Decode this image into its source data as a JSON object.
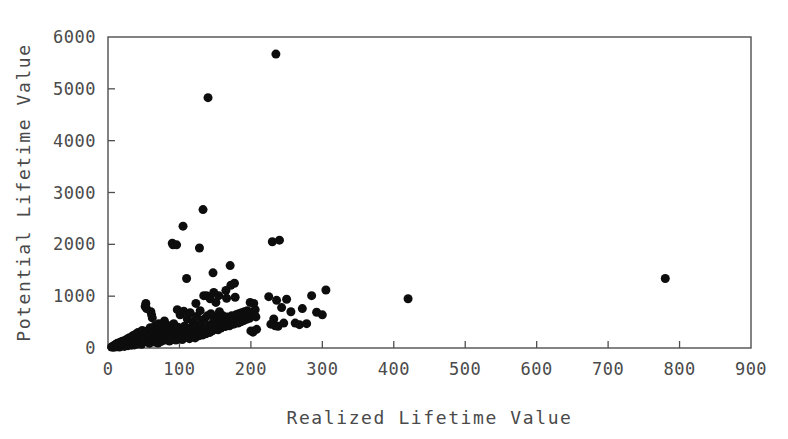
{
  "chart_data": {
    "type": "scatter",
    "title": "",
    "xlabel": "Realized Lifetime Value",
    "ylabel": "Potential Lifetime Value",
    "xlim": [
      0,
      900
    ],
    "ylim": [
      0,
      6000
    ],
    "xticks": [
      0,
      100,
      200,
      300,
      400,
      500,
      600,
      700,
      800,
      900
    ],
    "xtick_labels": [
      "0",
      "100",
      "200",
      "300",
      "400",
      "500",
      "600",
      "700",
      "800",
      "900"
    ],
    "yticks": [
      0,
      1000,
      2000,
      3000,
      4000,
      5000,
      6000
    ],
    "ytick_labels": [
      "0",
      "1000",
      "2000",
      "3000",
      "4000",
      "5000",
      "6000"
    ],
    "grid": false,
    "legend": null,
    "marker": {
      "shape": "circle",
      "color": "#0d0d0d",
      "size_px": 9
    },
    "frame_color": "#4f4f4f",
    "background": "#ffffff",
    "points": [
      [
        5,
        20
      ],
      [
        7,
        35
      ],
      [
        8,
        15
      ],
      [
        9,
        55
      ],
      [
        10,
        30
      ],
      [
        11,
        70
      ],
      [
        12,
        25
      ],
      [
        13,
        90
      ],
      [
        14,
        45
      ],
      [
        15,
        60
      ],
      [
        16,
        20
      ],
      [
        17,
        110
      ],
      [
        18,
        75
      ],
      [
        19,
        40
      ],
      [
        20,
        130
      ],
      [
        21,
        55
      ],
      [
        22,
        95
      ],
      [
        23,
        30
      ],
      [
        24,
        150
      ],
      [
        25,
        80
      ],
      [
        26,
        60
      ],
      [
        27,
        175
      ],
      [
        28,
        45
      ],
      [
        29,
        120
      ],
      [
        30,
        200
      ],
      [
        31,
        70
      ],
      [
        32,
        95
      ],
      [
        33,
        55
      ],
      [
        34,
        230
      ],
      [
        35,
        140
      ],
      [
        36,
        85
      ],
      [
        37,
        60
      ],
      [
        38,
        260
      ],
      [
        39,
        110
      ],
      [
        40,
        180
      ],
      [
        41,
        75
      ],
      [
        42,
        300
      ],
      [
        43,
        130
      ],
      [
        44,
        95
      ],
      [
        45,
        220
      ],
      [
        46,
        160
      ],
      [
        47,
        70
      ],
      [
        48,
        340
      ],
      [
        49,
        115
      ],
      [
        50,
        255
      ],
      [
        51,
        185
      ],
      [
        52,
        800
      ],
      [
        53,
        860
      ],
      [
        54,
        760
      ],
      [
        55,
        330
      ],
      [
        56,
        210
      ],
      [
        57,
        145
      ],
      [
        58,
        90
      ],
      [
        59,
        390
      ],
      [
        60,
        700
      ],
      [
        61,
        640
      ],
      [
        62,
        580
      ],
      [
        63,
        290
      ],
      [
        64,
        175
      ],
      [
        65,
        115
      ],
      [
        66,
        430
      ],
      [
        67,
        240
      ],
      [
        68,
        160
      ],
      [
        69,
        360
      ],
      [
        70,
        95
      ],
      [
        71,
        470
      ],
      [
        72,
        265
      ],
      [
        73,
        185
      ],
      [
        74,
        125
      ],
      [
        75,
        400
      ],
      [
        76,
        310
      ],
      [
        77,
        205
      ],
      [
        78,
        150
      ],
      [
        79,
        520
      ],
      [
        80,
        340
      ],
      [
        81,
        225
      ],
      [
        82,
        170
      ],
      [
        83,
        440
      ],
      [
        84,
        280
      ],
      [
        85,
        195
      ],
      [
        86,
        135
      ],
      [
        87,
        360
      ],
      [
        88,
        240
      ],
      [
        89,
        175
      ],
      [
        90,
        2020
      ],
      [
        91,
        1990
      ],
      [
        92,
        470
      ],
      [
        93,
        310
      ],
      [
        94,
        215
      ],
      [
        95,
        155
      ],
      [
        96,
        1990
      ],
      [
        97,
        740
      ],
      [
        98,
        400
      ],
      [
        99,
        265
      ],
      [
        100,
        190
      ],
      [
        101,
        640
      ],
      [
        102,
        350
      ],
      [
        103,
        230
      ],
      [
        104,
        165
      ],
      [
        105,
        2350
      ],
      [
        106,
        710
      ],
      [
        107,
        420
      ],
      [
        108,
        290
      ],
      [
        109,
        205
      ],
      [
        110,
        1340
      ],
      [
        111,
        560
      ],
      [
        112,
        330
      ],
      [
        113,
        245
      ],
      [
        114,
        180
      ],
      [
        115,
        680
      ],
      [
        116,
        395
      ],
      [
        117,
        270
      ],
      [
        118,
        215
      ],
      [
        119,
        510
      ],
      [
        120,
        355
      ],
      [
        121,
        260
      ],
      [
        122,
        195
      ],
      [
        123,
        860
      ],
      [
        124,
        610
      ],
      [
        125,
        430
      ],
      [
        126,
        300
      ],
      [
        127,
        235
      ],
      [
        128,
        1930
      ],
      [
        129,
        720
      ],
      [
        130,
        480
      ],
      [
        131,
        325
      ],
      [
        132,
        250
      ],
      [
        133,
        2670
      ],
      [
        134,
        1010
      ],
      [
        135,
        560
      ],
      [
        136,
        380
      ],
      [
        137,
        275
      ],
      [
        138,
        1010
      ],
      [
        139,
        620
      ],
      [
        140,
        4830
      ],
      [
        141,
        420
      ],
      [
        142,
        300
      ],
      [
        143,
        950
      ],
      [
        144,
        660
      ],
      [
        145,
        460
      ],
      [
        146,
        330
      ],
      [
        147,
        1450
      ],
      [
        148,
        1070
      ],
      [
        149,
        540
      ],
      [
        150,
        390
      ],
      [
        151,
        880
      ],
      [
        152,
        600
      ],
      [
        153,
        440
      ],
      [
        154,
        350
      ],
      [
        155,
        1010
      ],
      [
        156,
        700
      ],
      [
        157,
        490
      ],
      [
        158,
        385
      ],
      [
        159,
        560
      ],
      [
        160,
        420
      ],
      [
        161,
        620
      ],
      [
        162,
        470
      ],
      [
        163,
        540
      ],
      [
        164,
        415
      ],
      [
        165,
        1110
      ],
      [
        166,
        960
      ],
      [
        167,
        600
      ],
      [
        168,
        475
      ],
      [
        169,
        520
      ],
      [
        170,
        430
      ],
      [
        171,
        1590
      ],
      [
        172,
        1210
      ],
      [
        173,
        620
      ],
      [
        174,
        500
      ],
      [
        175,
        555
      ],
      [
        176,
        460
      ],
      [
        177,
        1250
      ],
      [
        178,
        980
      ],
      [
        179,
        640
      ],
      [
        180,
        520
      ],
      [
        181,
        590
      ],
      [
        182,
        480
      ],
      [
        183,
        660
      ],
      [
        184,
        540
      ],
      [
        185,
        600
      ],
      [
        186,
        505
      ],
      [
        187,
        680
      ],
      [
        188,
        560
      ],
      [
        189,
        620
      ],
      [
        190,
        530
      ],
      [
        191,
        700
      ],
      [
        192,
        580
      ],
      [
        193,
        640
      ],
      [
        194,
        555
      ],
      [
        195,
        720
      ],
      [
        196,
        600
      ],
      [
        197,
        660
      ],
      [
        198,
        575
      ],
      [
        199,
        880
      ],
      [
        200,
        330
      ],
      [
        201,
        690
      ],
      [
        202,
        620
      ],
      [
        203,
        305
      ],
      [
        204,
        860
      ],
      [
        205,
        640
      ],
      [
        206,
        740
      ],
      [
        207,
        600
      ],
      [
        208,
        360
      ],
      [
        230,
        2050
      ],
      [
        240,
        2080
      ],
      [
        225,
        990
      ],
      [
        232,
        560
      ],
      [
        228,
        460
      ],
      [
        236,
        920
      ],
      [
        243,
        780
      ],
      [
        238,
        420
      ],
      [
        246,
        480
      ],
      [
        234,
        430
      ],
      [
        250,
        940
      ],
      [
        256,
        700
      ],
      [
        262,
        480
      ],
      [
        268,
        450
      ],
      [
        272,
        760
      ],
      [
        278,
        470
      ],
      [
        285,
        1010
      ],
      [
        292,
        690
      ],
      [
        305,
        1120
      ],
      [
        300,
        640
      ],
      [
        235,
        5670
      ],
      [
        420,
        950
      ],
      [
        780,
        1340
      ]
    ]
  },
  "axis": {
    "x_label": "Realized Lifetime Value",
    "y_label": "Potential Lifetime Value"
  }
}
